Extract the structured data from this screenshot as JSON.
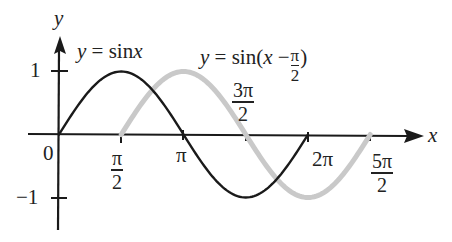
{
  "chart_data": {
    "type": "line",
    "title": "",
    "xlabel": "x",
    "ylabel": "y",
    "xlim": [
      -0.4,
      8.6
    ],
    "ylim": [
      -1.5,
      1.5
    ],
    "grid": false,
    "origin_label": "0",
    "x_ticks": [
      {
        "value": 1.5708,
        "label_num": "π",
        "label_den": "2"
      },
      {
        "value": 3.1416,
        "label": "π"
      },
      {
        "value": 4.7124,
        "label_num": "3π",
        "label_den": "2"
      },
      {
        "value": 6.2832,
        "label": "2π"
      },
      {
        "value": 7.854,
        "label_num": "5π",
        "label_den": "2"
      }
    ],
    "y_ticks": [
      {
        "value": 1,
        "label": "1"
      },
      {
        "value": -1,
        "label": "−1"
      }
    ],
    "series": [
      {
        "name": "y = sin x",
        "color": "#1a1a1a",
        "x_start": 0,
        "x_end": 6.2832,
        "x": [
          0,
          0.7854,
          1.5708,
          2.3562,
          3.1416,
          3.927,
          4.7124,
          5.4978,
          6.2832
        ],
        "values": [
          0,
          0.707,
          1,
          0.707,
          0,
          -0.707,
          -1,
          -0.707,
          0
        ]
      },
      {
        "name": "y = sin(x − π/2)",
        "color": "#c8c8c8",
        "x_start": 1.5708,
        "x_end": 7.854,
        "x": [
          1.5708,
          2.3562,
          3.1416,
          3.927,
          4.7124,
          5.4978,
          6.2832,
          7.0686,
          7.854
        ],
        "values": [
          0,
          0.707,
          1,
          0.707,
          0,
          -0.707,
          -1,
          -0.707,
          0
        ]
      }
    ],
    "annotations": [
      {
        "text": "y = sin x",
        "near_series": 0
      },
      {
        "text": "y = sin(x − π/2)",
        "near_series": 1
      }
    ]
  },
  "labels": {
    "y_axis": "y",
    "x_axis": "x",
    "origin": "0",
    "one": "1",
    "minus_one": "−1",
    "sin_label_y": "y",
    "sin_label_eq": " =  sin",
    "sin_label_x": "x",
    "shift_label_y": "y",
    "shift_label_eq": " =  sin(",
    "shift_label_x": "x",
    "shift_label_minus": " −",
    "shift_label_pi": "π",
    "shift_label_den": "2",
    "shift_label_close": ")",
    "tick_pi_half_num": "π",
    "tick_pi_half_den": "2",
    "tick_pi": "π",
    "tick_3pi_half_num": "3π",
    "tick_3pi_half_den": "2",
    "tick_2pi": "2π",
    "tick_5pi_half_num": "5π",
    "tick_5pi_half_den": "2"
  }
}
